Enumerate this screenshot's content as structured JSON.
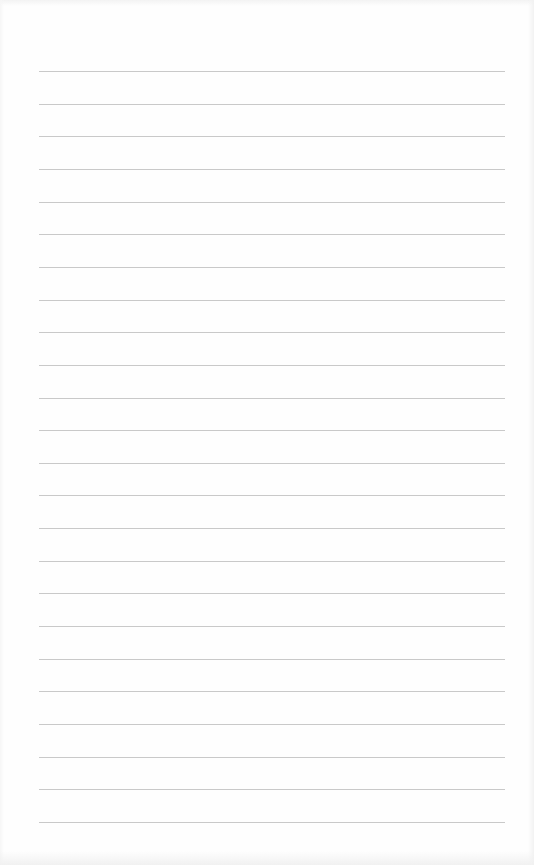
{
  "document": {
    "type": "lined-paper",
    "line_count": 24,
    "first_line_y": 71,
    "line_spacing": 32.65,
    "line_left": 39,
    "line_width": 466,
    "line_color": "#c9c9c9",
    "background_color": "#fefefe"
  }
}
